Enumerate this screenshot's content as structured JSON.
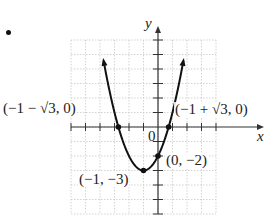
{
  "problem_marker": "•",
  "chart_data": {
    "type": "line",
    "title": "",
    "function": "y = x^2 + 2x - 2",
    "xlabel": "x",
    "ylabel": "y",
    "xlim": [
      -6,
      4
    ],
    "ylim": [
      -6,
      6
    ],
    "grid": true,
    "origin_label": "0",
    "series": [
      {
        "name": "parabola",
        "x": [
          -3.9,
          -3.5,
          -3,
          -2.732,
          -2.5,
          -2,
          -1.5,
          -1,
          -0.5,
          0,
          0.5,
          0.732,
          1,
          1.5,
          1.9
        ],
        "y": [
          5.41,
          3.25,
          1,
          0,
          -0.75,
          -2,
          -2.75,
          -3,
          -2.75,
          -2,
          -0.75,
          0,
          1,
          3.25,
          5.41
        ]
      }
    ],
    "points": [
      {
        "x": -2.732,
        "y": 0,
        "label": "(−1 − √3, 0)"
      },
      {
        "x": 0.732,
        "y": 0,
        "label": "(−1 + √3, 0)"
      },
      {
        "x": 0,
        "y": -2,
        "label": "(0, −2)"
      },
      {
        "x": -1,
        "y": -3,
        "label": "(−1, −3)"
      }
    ],
    "annotations": [
      "(−1 − √3, 0)",
      "(−1 + √3, 0)",
      "(0, −2)",
      "(−1, −3)",
      "0",
      "x",
      "y"
    ]
  },
  "labels": {
    "left_root": "(−1 − √3, 0)",
    "right_root": "(−1 + √3, 0)",
    "y_intercept": "(0, −2)",
    "vertex": "(−1, −3)",
    "origin": "0",
    "x_axis": "x",
    "y_axis": "y"
  },
  "colors": {
    "curve": "#111111",
    "grid": "#c8c8c8",
    "axes": "#333333"
  }
}
